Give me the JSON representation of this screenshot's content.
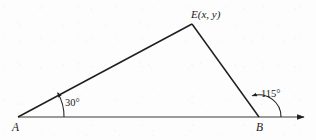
{
  "figure": {
    "type": "geometry-diagram",
    "canvas": {
      "width": 316,
      "height": 140
    },
    "background_color": "#fdfdfd",
    "line_color": "#1f1f1f",
    "text_color": "#1a1a1a"
  },
  "points": {
    "a": {
      "label": "A",
      "x": 18,
      "y": 117
    },
    "b": {
      "label": "B",
      "x": 259,
      "y": 117
    },
    "e": {
      "label": "E(x, y)",
      "x": 192,
      "y": 24
    }
  },
  "angles": {
    "at_a": {
      "label": "30°",
      "value": 30,
      "unit": "degrees",
      "vertex": "A"
    },
    "at_b": {
      "label": "115°",
      "value": 115,
      "unit": "degrees",
      "vertex": "B",
      "kind": "exterior"
    }
  },
  "segments": [
    {
      "name": "A-E",
      "from": "A",
      "to": "E"
    },
    {
      "name": "E-B",
      "from": "E",
      "to": "B"
    },
    {
      "name": "A-ray",
      "from": "A",
      "to": "ray-end",
      "arrow": true
    }
  ],
  "ray": {
    "end_x": 306,
    "y": 117,
    "arrowhead": true
  }
}
